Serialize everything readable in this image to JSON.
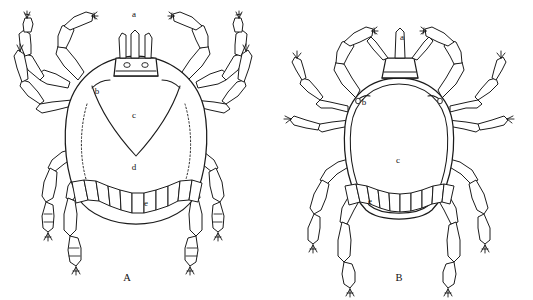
{
  "figure": {
    "type": "scientific-line-drawing",
    "background_color": "#ffffff",
    "ink_color": "#1b1b1b",
    "panels": [
      {
        "id": "A",
        "panel_label": "A",
        "caption_position": "bottom-center",
        "sex": "female",
        "labels": [
          {
            "key": "a",
            "text": "a",
            "part": "capitulum",
            "x": 134,
            "y": 17
          },
          {
            "key": "b",
            "text": "b",
            "part": "scapula",
            "x": 97,
            "y": 94
          },
          {
            "key": "c",
            "text": "c",
            "part": "scutum",
            "x": 134,
            "y": 118
          },
          {
            "key": "d",
            "text": "d",
            "part": "alloscutum",
            "x": 134,
            "y": 170
          },
          {
            "key": "e",
            "text": "e",
            "part": "festoons",
            "x": 146,
            "y": 206
          }
        ]
      },
      {
        "id": "B",
        "panel_label": "B",
        "caption_position": "bottom-center",
        "sex": "male",
        "labels": [
          {
            "key": "a",
            "text": "a",
            "part": "capitulum",
            "x": 402,
            "y": 40
          },
          {
            "key": "b",
            "text": "b",
            "part": "scapula",
            "x": 364,
            "y": 105
          },
          {
            "key": "c",
            "text": "c",
            "part": "scutum",
            "x": 398,
            "y": 163
          },
          {
            "key": "e",
            "text": "e",
            "part": "festoons",
            "x": 370,
            "y": 204
          }
        ]
      }
    ],
    "panel_captions": [
      {
        "text": "A",
        "x": 127,
        "y": 281
      },
      {
        "text": "B",
        "x": 399,
        "y": 281
      }
    ]
  }
}
